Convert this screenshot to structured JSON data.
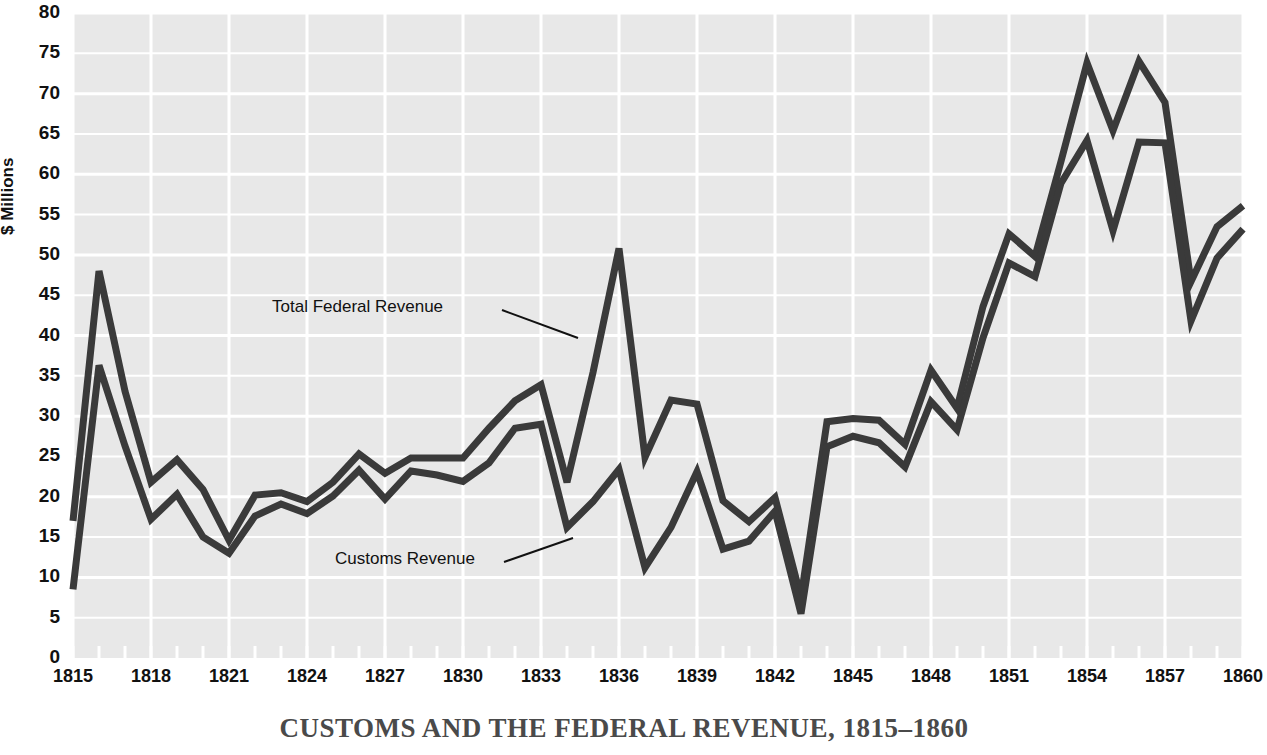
{
  "title": "CUSTOMS AND THE FEDERAL REVENUE, 1815–1860",
  "axes": {
    "ylabel": "$ Millions",
    "yticks": [
      "0",
      "5",
      "10",
      "15",
      "20",
      "25",
      "30",
      "35",
      "40",
      "45",
      "50",
      "55",
      "60",
      "65",
      "70",
      "75",
      "80"
    ],
    "xticks": [
      "1815",
      "1818",
      "1821",
      "1824",
      "1827",
      "1830",
      "1833",
      "1836",
      "1839",
      "1842",
      "1845",
      "1848",
      "1851",
      "1854",
      "1857",
      "1860"
    ]
  },
  "annotations": {
    "total": "Total Federal Revenue",
    "customs": "Customs Revenue"
  },
  "colors": {
    "plot_background": "#e8e8e8",
    "gridline": "#ffffff",
    "line": "#3a3a3a",
    "title": "#4a4a4a",
    "text": "#111111"
  },
  "chart_data": {
    "type": "line",
    "title": "CUSTOMS AND THE FEDERAL REVENUE, 1815–1860",
    "xlabel": "",
    "ylabel": "$ Millions",
    "xlim": [
      1815,
      1860
    ],
    "ylim": [
      0,
      80
    ],
    "ytick_step": 5,
    "xtick_step": 3,
    "grid": true,
    "legend": "inline-annotations",
    "x": [
      1815,
      1816,
      1817,
      1818,
      1819,
      1820,
      1821,
      1822,
      1823,
      1824,
      1825,
      1826,
      1827,
      1828,
      1829,
      1830,
      1831,
      1832,
      1833,
      1834,
      1835,
      1836,
      1837,
      1838,
      1839,
      1840,
      1841,
      1842,
      1843,
      1844,
      1845,
      1846,
      1847,
      1848,
      1849,
      1850,
      1851,
      1852,
      1853,
      1854,
      1855,
      1856,
      1857,
      1858,
      1859,
      1860
    ],
    "series": [
      {
        "name": "Total Federal Revenue",
        "values": [
          17.0,
          48.0,
          33.1,
          21.8,
          24.6,
          20.9,
          14.6,
          20.2,
          20.5,
          19.4,
          21.8,
          25.3,
          22.9,
          24.8,
          24.8,
          24.8,
          28.5,
          31.9,
          33.9,
          21.8,
          35.4,
          50.8,
          24.9,
          32.0,
          31.5,
          19.5,
          16.9,
          19.9,
          7.5,
          29.3,
          29.7,
          29.5,
          26.5,
          35.7,
          31.0,
          43.6,
          52.6,
          49.8,
          61.6,
          73.8,
          65.4,
          74.0,
          68.9,
          46.7,
          53.5,
          56.1
        ]
      },
      {
        "name": "Customs Revenue",
        "values": [
          8.5,
          36.3,
          26.3,
          17.2,
          20.3,
          15.0,
          13.0,
          17.6,
          19.1,
          17.9,
          20.1,
          23.3,
          19.7,
          23.2,
          22.7,
          21.9,
          24.2,
          28.5,
          29.0,
          16.2,
          19.4,
          23.4,
          11.2,
          16.2,
          23.1,
          13.5,
          14.5,
          18.2,
          5.5,
          26.2,
          27.5,
          26.7,
          23.7,
          31.8,
          28.3,
          39.7,
          49.0,
          47.3,
          58.9,
          64.2,
          53.0,
          64.0,
          63.9,
          41.8,
          49.6,
          53.2
        ]
      }
    ]
  }
}
